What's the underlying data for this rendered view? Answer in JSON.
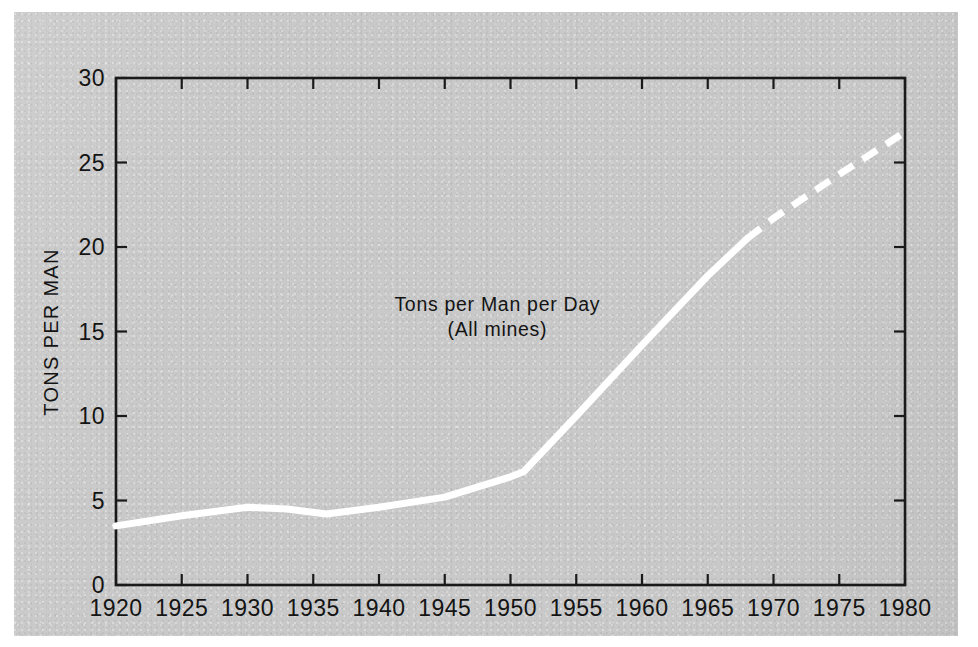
{
  "figure": {
    "background_color": "#c9c9c9",
    "page_color": "#ffffff",
    "series_color": "#ffffff",
    "axis_color": "#1a1a1a"
  },
  "chart_data": {
    "type": "line",
    "title": "",
    "xlabel": "",
    "ylabel": "TONS PER MAN",
    "xlim": [
      1920,
      1980
    ],
    "ylim": [
      0,
      30
    ],
    "grid": false,
    "legend_position": "none",
    "x_ticks": [
      1920,
      1925,
      1930,
      1935,
      1940,
      1945,
      1950,
      1955,
      1960,
      1965,
      1970,
      1975,
      1980
    ],
    "x_tick_labels": [
      "1920",
      "1925",
      "1930",
      "1935",
      "1940",
      "1945",
      "1950",
      "1955",
      "1960",
      "1965",
      "1970",
      "1975",
      "1980"
    ],
    "y_ticks": [
      0,
      5,
      10,
      15,
      20,
      25,
      30
    ],
    "y_tick_labels": [
      "0",
      "5",
      "10",
      "15",
      "20",
      "25",
      "30"
    ],
    "annotations": [
      {
        "name": "series-caption",
        "line1": "Tons per Man per Day",
        "line2": "(All mines)",
        "x": 1949,
        "y": 16.2
      }
    ],
    "series": [
      {
        "name": "Tons per Man per Day (All mines)",
        "style": "solid",
        "note": "historical record",
        "x": [
          1920,
          1925,
          1930,
          1933,
          1936,
          1940,
          1945,
          1950,
          1951,
          1955,
          1960,
          1965,
          1968
        ],
        "values": [
          3.5,
          4.1,
          4.6,
          4.5,
          4.2,
          4.6,
          5.2,
          6.4,
          6.7,
          10.0,
          14.2,
          18.3,
          20.5
        ]
      },
      {
        "name": "Tons per Man per Day (All mines) — projection",
        "style": "dashed",
        "note": "projected trend",
        "x": [
          1968,
          1970,
          1975,
          1980
        ],
        "values": [
          20.5,
          21.7,
          24.3,
          26.8
        ]
      }
    ]
  }
}
